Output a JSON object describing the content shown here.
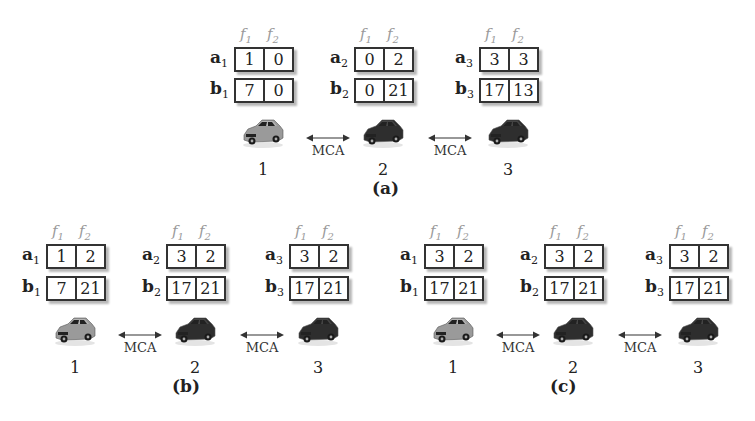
{
  "feature_headers": [
    "f1",
    "f2"
  ],
  "link_label": "MCA",
  "colors": {
    "car_light": "#9a9a9a",
    "car_dark": "#2e2e2e",
    "border": "#333333"
  },
  "panels": [
    {
      "caption": "(a)",
      "nodes": [
        {
          "index": "1",
          "a_label": "a",
          "b_label": "b",
          "sub": "1",
          "a": [
            "1",
            "0"
          ],
          "b": [
            "7",
            "0"
          ],
          "car": "light"
        },
        {
          "index": "2",
          "a_label": "a",
          "b_label": "b",
          "sub": "2",
          "a": [
            "0",
            "2"
          ],
          "b": [
            "0",
            "21"
          ],
          "car": "dark"
        },
        {
          "index": "3",
          "a_label": "a",
          "b_label": "b",
          "sub": "3",
          "a": [
            "3",
            "3"
          ],
          "b": [
            "17",
            "13"
          ],
          "car": "dark"
        }
      ]
    },
    {
      "caption": "(b)",
      "nodes": [
        {
          "index": "1",
          "a_label": "a",
          "b_label": "b",
          "sub": "1",
          "a": [
            "1",
            "2"
          ],
          "b": [
            "7",
            "21"
          ],
          "car": "light"
        },
        {
          "index": "2",
          "a_label": "a",
          "b_label": "b",
          "sub": "2",
          "a": [
            "3",
            "2"
          ],
          "b": [
            "17",
            "21"
          ],
          "car": "dark"
        },
        {
          "index": "3",
          "a_label": "a",
          "b_label": "b",
          "sub": "3",
          "a": [
            "3",
            "2"
          ],
          "b": [
            "17",
            "21"
          ],
          "car": "dark"
        }
      ]
    },
    {
      "caption": "(c)",
      "nodes": [
        {
          "index": "1",
          "a_label": "a",
          "b_label": "b",
          "sub": "1",
          "a": [
            "3",
            "2"
          ],
          "b": [
            "17",
            "21"
          ],
          "car": "light"
        },
        {
          "index": "2",
          "a_label": "a",
          "b_label": "b",
          "sub": "2",
          "a": [
            "3",
            "2"
          ],
          "b": [
            "17",
            "21"
          ],
          "car": "dark"
        },
        {
          "index": "3",
          "a_label": "a",
          "b_label": "b",
          "sub": "3",
          "a": [
            "3",
            "2"
          ],
          "b": [
            "17",
            "21"
          ],
          "car": "dark"
        }
      ]
    }
  ]
}
